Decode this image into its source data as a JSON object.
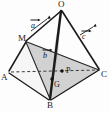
{
  "figure": {
    "background_color": "#fdfdfd",
    "line_color": "#1a1a1a",
    "shade_color": "#c9c9c9",
    "shade_color_dark": "#b3b3b3"
  },
  "vertices": [
    {
      "id": "O",
      "label": "O",
      "x": 61,
      "y": 8
    },
    {
      "id": "M",
      "label": "M",
      "x": 26,
      "y": 41
    },
    {
      "id": "A",
      "label": "A",
      "x": 9,
      "y": 73
    },
    {
      "id": "C",
      "label": "C",
      "x": 100,
      "y": 70
    },
    {
      "id": "B",
      "label": "B",
      "x": 50,
      "y": 100
    }
  ],
  "interior_points": [
    {
      "id": "P",
      "label": "P",
      "x": 64,
      "y": 71
    },
    {
      "id": "G",
      "label": "G",
      "x": 53,
      "y": 81
    }
  ],
  "vector_labels": [
    {
      "id": "a",
      "label": "a",
      "x": 34,
      "y": 22
    },
    {
      "id": "b",
      "label": "b",
      "x": 45,
      "y": 52
    },
    {
      "id": "c",
      "label": "c",
      "x": 84,
      "y": 32
    }
  ],
  "point_labels": {
    "O": "O",
    "M": "M",
    "A": "A",
    "B": "B",
    "C": "C",
    "P": "P",
    "G": "G"
  },
  "edges": [
    {
      "from": "O",
      "to": "M",
      "style": "solid"
    },
    {
      "from": "M",
      "to": "A",
      "style": "solid"
    },
    {
      "from": "O",
      "to": "C",
      "style": "solid"
    },
    {
      "from": "O",
      "to": "B",
      "style": "solid-thick"
    },
    {
      "from": "A",
      "to": "B",
      "style": "solid"
    },
    {
      "from": "B",
      "to": "C",
      "style": "solid"
    },
    {
      "from": "A",
      "to": "C",
      "style": "dashed"
    },
    {
      "from": "M",
      "to": "B",
      "style": "solid"
    },
    {
      "from": "M",
      "to": "C",
      "style": "solid"
    }
  ],
  "shaded_faces": [
    {
      "id": "face-MBC",
      "points": "M,B,C"
    }
  ]
}
